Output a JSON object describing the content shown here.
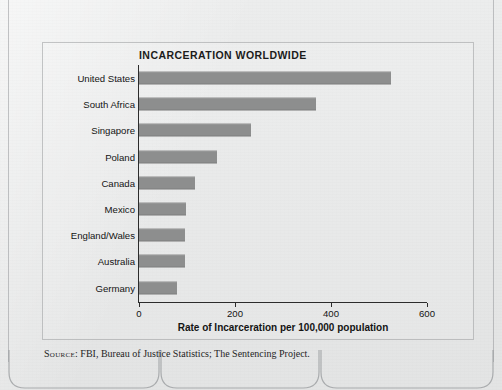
{
  "chart_data": {
    "type": "bar",
    "orientation": "horizontal",
    "title": "INCARCERATION WORLDWIDE",
    "xlabel": "Rate of Incarceration per 100,000 population",
    "ylabel": "",
    "xlim": [
      0,
      600
    ],
    "xticks": [
      0,
      200,
      400,
      600
    ],
    "xtick_labels": [
      "0",
      "200",
      "400",
      "600"
    ],
    "grid": false,
    "legend": null,
    "bar_color": "#8d8e8e",
    "categories": [
      "United States",
      "South Africa",
      "Singapore",
      "Poland",
      "Canada",
      "Mexico",
      "England/Wales",
      "Australia",
      "Germany"
    ],
    "values": [
      525,
      368,
      233,
      162,
      116,
      97,
      96,
      95,
      80
    ],
    "bars": [
      {
        "category": "United States",
        "value": 525
      },
      {
        "category": "South Africa",
        "value": 368
      },
      {
        "category": "Singapore",
        "value": 233
      },
      {
        "category": "Poland",
        "value": 162
      },
      {
        "category": "Canada",
        "value": 116
      },
      {
        "category": "Mexico",
        "value": 97
      },
      {
        "category": "England/Wales",
        "value": 96
      },
      {
        "category": "Australia",
        "value": 95
      },
      {
        "category": "Germany",
        "value": 80
      }
    ]
  },
  "source": {
    "prefix": "Source",
    "text": ": FBI, Bureau of Justice Statistics; The Sentencing Project."
  }
}
